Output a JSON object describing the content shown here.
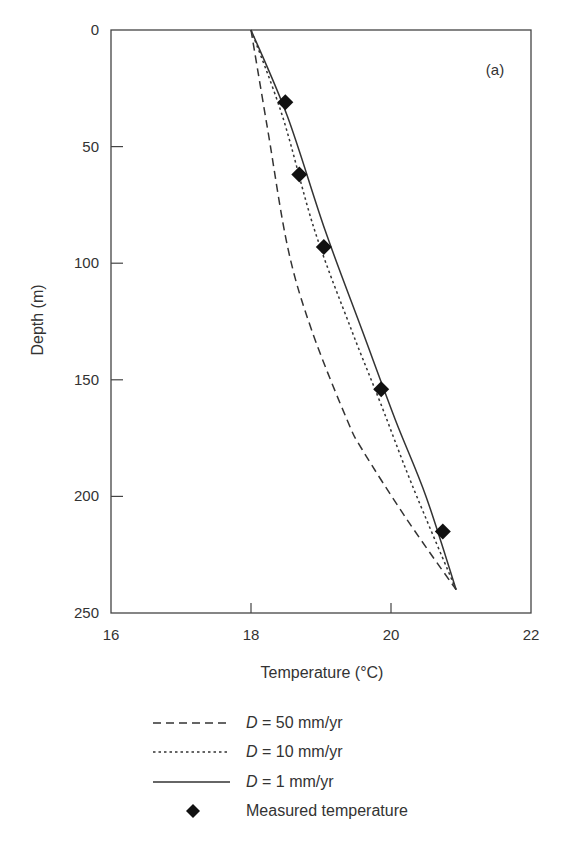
{
  "chart_data": {
    "type": "line",
    "title": "",
    "panel_label": "(a)",
    "xlabel": "Temperature (°C)",
    "ylabel": "Depth (m)",
    "xlim": [
      16,
      22
    ],
    "ylim": [
      250,
      0
    ],
    "y_inverted": true,
    "xticks": [
      16,
      18,
      20,
      22
    ],
    "yticks": [
      0,
      50,
      100,
      150,
      200,
      250
    ],
    "grid": false,
    "legend_position": "below plot",
    "series": [
      {
        "name": "D = 50 mm/yr",
        "style": "dashed",
        "x": [
          18.0,
          18.24,
          18.53,
          18.87,
          19.37,
          19.59,
          20.23,
          20.93
        ],
        "y": [
          0,
          43,
          94,
          129,
          167,
          180,
          210,
          240
        ]
      },
      {
        "name": "D = 10 mm/yr",
        "style": "dotted",
        "x": [
          18.0,
          18.45,
          18.91,
          19.44,
          19.85,
          20.3,
          20.93
        ],
        "y": [
          0,
          37,
          86,
          129,
          160,
          195,
          240
        ]
      },
      {
        "name": "D = 1 mm/yr",
        "style": "solid",
        "x": [
          18.0,
          18.52,
          19.06,
          19.59,
          20.06,
          20.5,
          20.93
        ],
        "y": [
          0,
          37,
          86,
          129,
          167,
          200,
          240
        ]
      },
      {
        "name": "Measured temperature",
        "style": "marker-diamond",
        "x": [
          18.49,
          18.69,
          19.04,
          19.86,
          20.74
        ],
        "y": [
          31,
          62,
          93,
          154,
          215
        ]
      }
    ]
  },
  "legend": {
    "items": [
      {
        "var": "D",
        "text": " = 50 mm/yr"
      },
      {
        "var": "D",
        "text": " = 10 mm/yr"
      },
      {
        "var": "D",
        "text": " = 1 mm/yr"
      },
      {
        "var": "",
        "text": "Measured temperature"
      }
    ]
  }
}
